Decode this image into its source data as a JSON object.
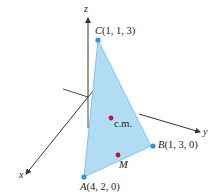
{
  "figure": {
    "axes": {
      "x": "x",
      "y": "y",
      "z": "z"
    },
    "points": {
      "A": {
        "name": "A",
        "coords": "(4, 2, 0)"
      },
      "B": {
        "name": "B",
        "coords": "(1, 3, 0)"
      },
      "C": {
        "name": "C",
        "coords": "(1, 1, 3)"
      },
      "cm": {
        "name": "c.m."
      },
      "M": {
        "name": "M"
      }
    },
    "colors": {
      "triangle_fill": "#a9d8f2",
      "triangle_edge": "#5fb4de",
      "vertex_dot": "#2a9ad4",
      "marker_dot": "#c8102e",
      "axis": "#333333"
    }
  }
}
